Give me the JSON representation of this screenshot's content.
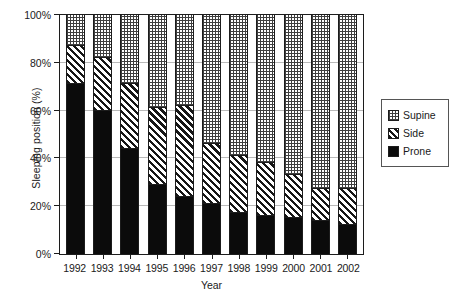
{
  "chart_data": {
    "type": "bar",
    "stacked": true,
    "title": "",
    "xlabel": "Year",
    "ylabel": "Sleeping position (%)",
    "ylim": [
      0,
      100
    ],
    "yticks": [
      0,
      20,
      40,
      60,
      80,
      100
    ],
    "ytick_labels": [
      "0%",
      "20%",
      "40%",
      "60%",
      "80%",
      "100%"
    ],
    "grid": true,
    "grid_axis": "y",
    "legend_position": "right",
    "legend_entries": [
      "Supine",
      "Side",
      "Prone"
    ],
    "categories": [
      "1992",
      "1993",
      "1994",
      "1995",
      "1996",
      "1997",
      "1998",
      "1999",
      "2000",
      "2001",
      "2002"
    ],
    "series": [
      {
        "name": "Prone",
        "pattern": "solid-black",
        "values": [
          71,
          60,
          44,
          29,
          24,
          21,
          17,
          16,
          15,
          14,
          12
        ]
      },
      {
        "name": "Side",
        "pattern": "diagonal-hatch",
        "values": [
          16,
          22,
          27,
          32,
          38,
          25,
          24,
          22,
          18,
          13,
          15
        ]
      },
      {
        "name": "Supine",
        "pattern": "fine-grid-dots",
        "values": [
          13,
          18,
          29,
          39,
          38,
          54,
          59,
          62,
          67,
          73,
          73
        ]
      }
    ],
    "cumulative_tops": {
      "prone": [
        71,
        60,
        44,
        29,
        24,
        21,
        17,
        16,
        15,
        14,
        12
      ],
      "prone_side": [
        87,
        82,
        71,
        61,
        62,
        46,
        41,
        38,
        33,
        27,
        27
      ],
      "total": [
        100,
        100,
        100,
        100,
        100,
        100,
        100,
        100,
        100,
        100,
        100
      ]
    }
  },
  "legend": {
    "items": [
      {
        "label": "Supine",
        "swatch": "fine-grid-dots"
      },
      {
        "label": "Side",
        "swatch": "diagonal-hatch"
      },
      {
        "label": "Prone",
        "swatch": "solid-black"
      }
    ]
  },
  "axes": {
    "y_title": "Sleeping position (%)",
    "x_title": "Year"
  },
  "colors": {
    "axis": "#1c1c1c",
    "gridline": "#b9b9b9",
    "prone_fill": "#0b0b0b",
    "hatch": "#161616",
    "background": "#ffffff",
    "legend_border": "#555555"
  }
}
